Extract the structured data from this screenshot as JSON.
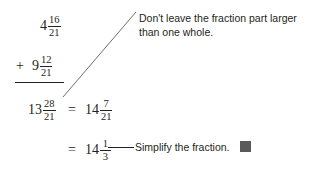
{
  "problem": {
    "type": "mixed-number-addition",
    "lines": [
      {
        "id": "addend-1",
        "operator": "",
        "whole": "4",
        "numerator": "16",
        "denominator": "21"
      },
      {
        "id": "addend-2",
        "operator": "+",
        "whole": "9",
        "numerator": "12",
        "denominator": "21"
      },
      {
        "id": "sum",
        "operator": "",
        "whole": "13",
        "numerator": "28",
        "denominator": "21"
      },
      {
        "id": "regrouped",
        "operator": "=",
        "whole": "14",
        "numerator": "7",
        "denominator": "21"
      },
      {
        "id": "simplified",
        "operator": "=",
        "whole": "14",
        "numerator": "1",
        "denominator": "3"
      }
    ]
  },
  "annotations": {
    "improper_fraction_note": "Don't leave the fraction part larger\nthan one whole.",
    "simplify_note": "Simplify the fraction."
  },
  "colors": {
    "ink": "#231f20",
    "leader": "#6d6e71",
    "end_marker": "#58595b",
    "page": "#ffffff"
  }
}
